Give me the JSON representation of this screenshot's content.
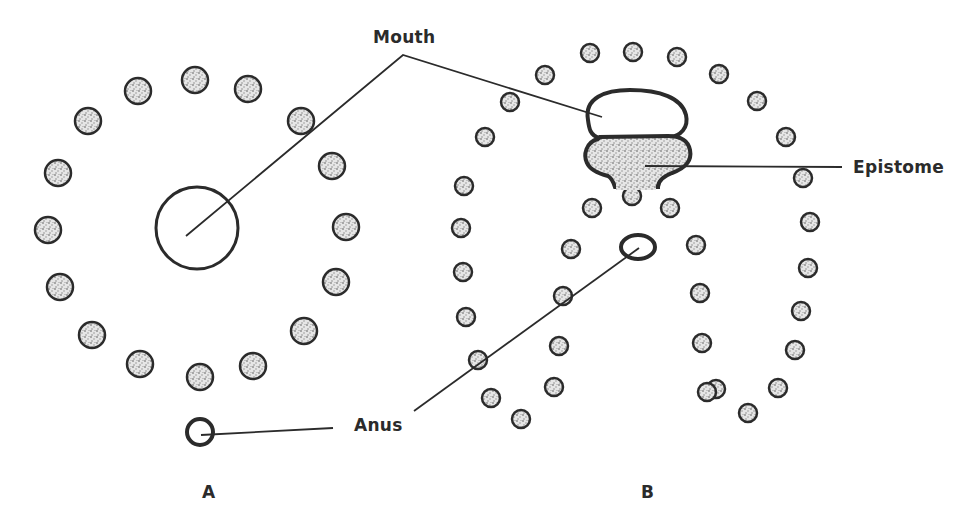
{
  "figure": {
    "labels": {
      "mouth": "Mouth",
      "epistome": "Epistome",
      "anus": "Anus"
    },
    "panels": [
      {
        "id": "A",
        "label": "A"
      },
      {
        "id": "B",
        "label": "B"
      }
    ]
  },
  "colors": {
    "ink": "#2b2b2b",
    "stipple": "#b8b8b8",
    "background": "#ffffff"
  },
  "panel_a": {
    "mouth": {
      "cx": 197,
      "cy": 228,
      "r": 41
    },
    "anus": {
      "cx": 200,
      "cy": 432,
      "rx": 13,
      "ry": 13
    },
    "tentacles": [
      [
        195,
        80
      ],
      [
        138,
        91
      ],
      [
        248,
        89
      ],
      [
        88,
        121
      ],
      [
        301,
        121
      ],
      [
        58,
        173
      ],
      [
        332,
        166
      ],
      [
        48,
        230
      ],
      [
        346,
        227
      ],
      [
        60,
        287
      ],
      [
        336,
        282
      ],
      [
        92,
        335
      ],
      [
        304,
        331
      ],
      [
        140,
        364
      ],
      [
        253,
        366
      ],
      [
        200,
        377
      ]
    ]
  },
  "panel_b": {
    "anus": {
      "cx": 638,
      "cy": 247,
      "rx": 17,
      "ry": 12
    },
    "tentacles": [
      [
        590,
        53
      ],
      [
        633,
        52
      ],
      [
        677,
        57
      ],
      [
        719,
        74
      ],
      [
        545,
        75
      ],
      [
        757,
        101
      ],
      [
        510,
        102
      ],
      [
        786,
        137
      ],
      [
        485,
        137
      ],
      [
        803,
        178
      ],
      [
        464,
        186
      ],
      [
        810,
        222
      ],
      [
        461,
        228
      ],
      [
        808,
        268
      ],
      [
        463,
        272
      ],
      [
        801,
        311
      ],
      [
        466,
        317
      ],
      [
        795,
        350
      ],
      [
        478,
        360
      ],
      [
        778,
        388
      ],
      [
        491,
        398
      ],
      [
        716,
        389
      ],
      [
        748,
        413
      ],
      [
        521,
        419
      ],
      [
        632,
        196
      ],
      [
        592,
        208
      ],
      [
        670,
        208
      ],
      [
        571,
        249
      ],
      [
        696,
        245
      ],
      [
        563,
        296
      ],
      [
        700,
        293
      ],
      [
        559,
        346
      ],
      [
        702,
        343
      ],
      [
        554,
        387
      ],
      [
        707,
        392
      ]
    ]
  }
}
